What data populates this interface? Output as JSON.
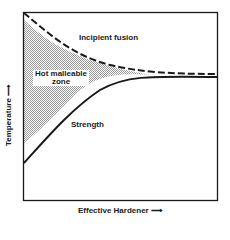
{
  "diagram": {
    "type": "phase-region diagram",
    "x_axis_label": "Effective Hardener",
    "y_axis_label": "Temperature",
    "arrow_glyph": "⟶",
    "curves": [
      {
        "name": "Incipient fusion",
        "style": "dashed",
        "trend": "decreasing, converging right"
      },
      {
        "name": "Strength",
        "style": "solid",
        "trend": "increasing, leveling off right"
      }
    ],
    "region": {
      "name": "Hot malleable zone",
      "line1": "Hot malleable",
      "line2": "zone",
      "fill": "stippled gray"
    },
    "colors": {
      "line": "#1a1a1a",
      "fill": "#b8b8b8",
      "background": "#ffffff"
    }
  }
}
